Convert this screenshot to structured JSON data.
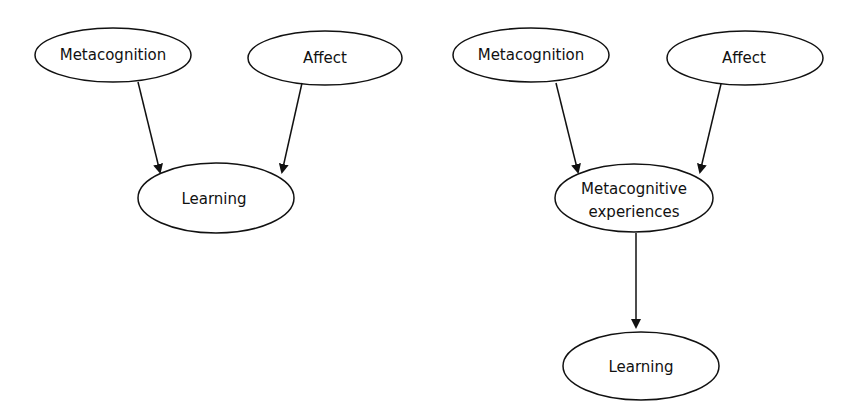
{
  "diagrams": [
    {
      "nodes": {
        "metacognition": {
          "label": "Metacognition"
        },
        "affect": {
          "label": "Affect"
        },
        "learning": {
          "label": "Learning"
        }
      },
      "edges": [
        {
          "from": "metacognition",
          "to": "learning"
        },
        {
          "from": "affect",
          "to": "learning"
        }
      ]
    },
    {
      "nodes": {
        "metacognition": {
          "label": "Metacognition"
        },
        "affect": {
          "label": "Affect"
        },
        "metacognitive_experiences": {
          "line1": "Metacognitive",
          "line2": "experiences"
        },
        "learning": {
          "label": "Learning"
        }
      },
      "edges": [
        {
          "from": "metacognition",
          "to": "metacognitive_experiences"
        },
        {
          "from": "affect",
          "to": "metacognitive_experiences"
        },
        {
          "from": "metacognitive_experiences",
          "to": "learning"
        }
      ]
    }
  ],
  "colors": {
    "stroke": "#111111",
    "background": "#ffffff"
  }
}
